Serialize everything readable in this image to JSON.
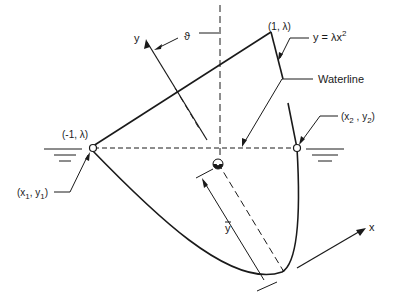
{
  "diagram": {
    "type": "floating parabolic hull cross-section",
    "labels": {
      "y_axis": "y",
      "x_axis": "x",
      "theta": "ϑ",
      "top_left_point": "(-1, λ)",
      "top_right_point": "(1, λ)",
      "curve_equation": "y = λx",
      "curve_exponent": "2",
      "waterline": "Waterline",
      "left_intersection": "(x",
      "left_intersection_sub": "1",
      "left_intersection_mid": ", y",
      "left_intersection_sub2": "1",
      "left_intersection_end": ")",
      "right_intersection": "(x",
      "right_intersection_sub": "2",
      "right_intersection_mid": " , y",
      "right_intersection_sub2": "2",
      "right_intersection_end": ")",
      "y_bar": "y"
    },
    "colors": {
      "stroke": "#1a1a1a",
      "background": "#ffffff"
    }
  }
}
